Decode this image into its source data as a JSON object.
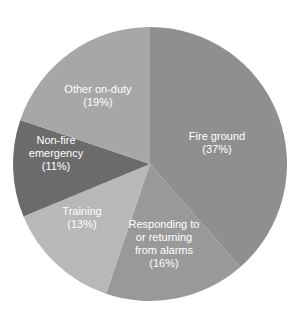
{
  "chart_data": {
    "type": "pie",
    "title": "",
    "start_angle": "12 o'clock",
    "direction": "clockwise",
    "categories": [
      "Fire ground",
      "Responding to or returning from alarms",
      "Training",
      "Non-fire emergency",
      "Other on-duty"
    ],
    "values": [
      37,
      16,
      13,
      11,
      19
    ],
    "unit": "%",
    "slices": [
      {
        "name": "Fire ground",
        "value": 37,
        "label_lines": [
          "Fire ground",
          "(37%)"
        ],
        "color": "#8f8f8f",
        "label_pos": [
          217,
          142
        ]
      },
      {
        "name": "Responding to or returning from alarms",
        "value": 16,
        "label_lines": [
          "Responding to",
          "or returning",
          "from alarms",
          "(16%)"
        ],
        "color": "#999999",
        "label_pos": [
          164,
          243
        ]
      },
      {
        "name": "Training",
        "value": 13,
        "label_lines": [
          "Training",
          "(13%)"
        ],
        "color": "#b8b8b8",
        "label_pos": [
          82,
          217
        ]
      },
      {
        "name": "Non-fire emergency",
        "value": 11,
        "label_lines": [
          "Non-fire",
          "emergency",
          "(11%)"
        ],
        "color": "#6b6b6b",
        "label_pos": [
          56,
          153
        ]
      },
      {
        "name": "Other on-duty",
        "value": 19,
        "label_lines": [
          "Other on-duty",
          "(19%)"
        ],
        "color": "#a7a7a7",
        "label_pos": [
          98,
          95
        ]
      }
    ],
    "legend": "none",
    "grid": false
  }
}
